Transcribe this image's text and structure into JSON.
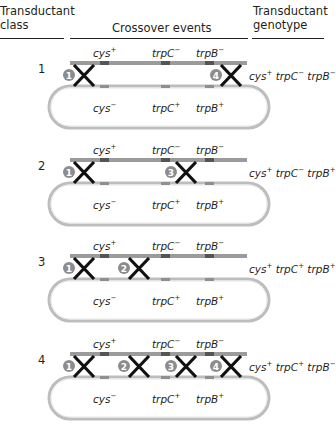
{
  "header": {
    "class_col": [
      "Transductant",
      "class"
    ],
    "events_col": "Crossover events",
    "genotype_col": [
      "Transductant",
      "genotype"
    ]
  },
  "donor_labels": [
    {
      "gene": "cys",
      "allele": "+"
    },
    {
      "gene": "trpC",
      "allele": "−"
    },
    {
      "gene": "trpB",
      "allele": "−"
    }
  ],
  "recipient_labels": [
    {
      "gene": "cys",
      "allele": "−"
    },
    {
      "gene": "trpC",
      "allele": "+"
    },
    {
      "gene": "trpB",
      "allele": "+"
    }
  ],
  "colors": {
    "donor_bar": "#9b9b9b",
    "donor_marker": "#555555",
    "recipient_bar": "#bdbdbd",
    "recipient_marker": "#8f8f8f",
    "badge": "#8c8c8c",
    "cross": "#111111"
  },
  "rows": [
    {
      "class": "1",
      "crossovers": [
        1,
        4
      ],
      "genotype": [
        {
          "gene": "cys",
          "allele": "+"
        },
        {
          "gene": "trpC",
          "allele": "−"
        },
        {
          "gene": "trpB",
          "allele": "−"
        }
      ]
    },
    {
      "class": "2",
      "crossovers": [
        1,
        3
      ],
      "genotype": [
        {
          "gene": "cys",
          "allele": "+"
        },
        {
          "gene": "trpC",
          "allele": "−"
        },
        {
          "gene": "trpB",
          "allele": "+"
        }
      ]
    },
    {
      "class": "3",
      "crossovers": [
        1,
        2
      ],
      "genotype": [
        {
          "gene": "cys",
          "allele": "+"
        },
        {
          "gene": "trpC",
          "allele": "+"
        },
        {
          "gene": "trpB",
          "allele": "+"
        }
      ]
    },
    {
      "class": "4",
      "crossovers": [
        1,
        2,
        3,
        4
      ],
      "genotype": [
        {
          "gene": "cys",
          "allele": "+"
        },
        {
          "gene": "trpC",
          "allele": "+"
        },
        {
          "gene": "trpB",
          "allele": "−"
        }
      ]
    }
  ]
}
